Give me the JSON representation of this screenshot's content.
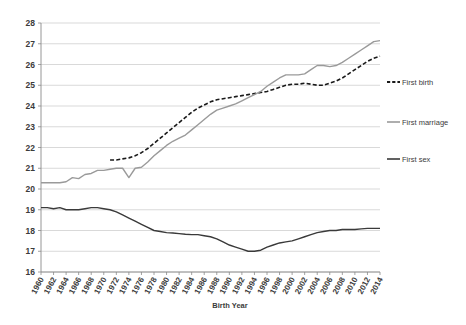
{
  "chart_data": {
    "type": "line",
    "title": "",
    "xlabel": "Birth Year",
    "ylabel": "",
    "xlim": [
      1960,
      2014
    ],
    "ylim": [
      16,
      28
    ],
    "grid": true,
    "legend_position": "right",
    "x_tick_labels": [
      "1960",
      "1962",
      "1964",
      "1966",
      "1968",
      "1970",
      "1972",
      "1974",
      "1976",
      "1978",
      "1980",
      "1982",
      "1984",
      "1986",
      "1988",
      "1990",
      "1992",
      "1994",
      "1996",
      "1998",
      "2000",
      "2002",
      "2004",
      "2006",
      "2008",
      "2010",
      "2012",
      "2014"
    ],
    "y_tick_labels": [
      "16",
      "17",
      "18",
      "19",
      "20",
      "21",
      "22",
      "23",
      "24",
      "25",
      "26",
      "27",
      "28"
    ],
    "x": [
      1960,
      1961,
      1962,
      1963,
      1964,
      1965,
      1966,
      1967,
      1968,
      1969,
      1970,
      1971,
      1972,
      1973,
      1974,
      1975,
      1976,
      1977,
      1978,
      1979,
      1980,
      1981,
      1982,
      1983,
      1984,
      1985,
      1986,
      1987,
      1988,
      1989,
      1990,
      1991,
      1992,
      1993,
      1994,
      1995,
      1996,
      1997,
      1998,
      1999,
      2000,
      2001,
      2002,
      2003,
      2004,
      2005,
      2006,
      2007,
      2008,
      2009,
      2010,
      2011,
      2012,
      2013,
      2014
    ],
    "series": [
      {
        "name": "First birth",
        "color": "#1a1a1a",
        "style": "dashed",
        "x": [
          1971,
          1972,
          1973,
          1974,
          1975,
          1976,
          1977,
          1978,
          1979,
          1980,
          1981,
          1982,
          1983,
          1984,
          1985,
          1986,
          1987,
          1988,
          1989,
          1990,
          1991,
          1992,
          1993,
          1994,
          1995,
          1996,
          1997,
          1998,
          1999,
          2000,
          2001,
          2002,
          2003,
          2004,
          2005,
          2006,
          2007,
          2008,
          2009,
          2010,
          2011,
          2012,
          2013,
          2014
        ],
        "values": [
          21.4,
          21.4,
          21.45,
          21.5,
          21.6,
          21.75,
          21.95,
          22.2,
          22.45,
          22.7,
          22.95,
          23.2,
          23.45,
          23.7,
          23.9,
          24.05,
          24.2,
          24.3,
          24.35,
          24.4,
          24.45,
          24.5,
          24.55,
          24.6,
          24.65,
          24.7,
          24.8,
          24.9,
          25.0,
          25.05,
          25.05,
          25.1,
          25.05,
          25.0,
          25.0,
          25.1,
          25.2,
          25.35,
          25.55,
          25.75,
          25.95,
          26.15,
          26.3,
          26.4
        ]
      },
      {
        "name": "First marriage",
        "color": "#9a9a9a",
        "style": "solid",
        "x": [
          1960,
          1961,
          1962,
          1963,
          1964,
          1965,
          1966,
          1967,
          1968,
          1969,
          1970,
          1971,
          1972,
          1973,
          1974,
          1975,
          1976,
          1977,
          1978,
          1979,
          1980,
          1981,
          1982,
          1983,
          1984,
          1985,
          1986,
          1987,
          1988,
          1989,
          1990,
          1991,
          1992,
          1993,
          1994,
          1995,
          1996,
          1997,
          1998,
          1999,
          2000,
          2001,
          2002,
          2003,
          2004,
          2005,
          2006,
          2007,
          2008,
          2009,
          2010,
          2011,
          2012,
          2013,
          2014
        ],
        "values": [
          20.3,
          20.3,
          20.3,
          20.3,
          20.35,
          20.55,
          20.5,
          20.7,
          20.75,
          20.9,
          20.9,
          20.95,
          21.0,
          21.0,
          20.55,
          21.0,
          21.05,
          21.3,
          21.6,
          21.85,
          22.1,
          22.3,
          22.45,
          22.6,
          22.85,
          23.1,
          23.35,
          23.6,
          23.8,
          23.9,
          24.0,
          24.1,
          24.25,
          24.4,
          24.55,
          24.7,
          24.95,
          25.15,
          25.35,
          25.5,
          25.5,
          25.5,
          25.55,
          25.75,
          25.95,
          25.95,
          25.9,
          25.95,
          26.1,
          26.3,
          26.5,
          26.7,
          26.9,
          27.1,
          27.15
        ]
      },
      {
        "name": "First sex",
        "color": "#3a3a3a",
        "style": "solid",
        "x": [
          1960,
          1961,
          1962,
          1963,
          1964,
          1965,
          1966,
          1967,
          1968,
          1969,
          1970,
          1971,
          1972,
          1973,
          1974,
          1975,
          1976,
          1977,
          1978,
          1979,
          1980,
          1981,
          1982,
          1983,
          1984,
          1985,
          1986,
          1987,
          1988,
          1989,
          1990,
          1991,
          1992,
          1993,
          1994,
          1995,
          1996,
          1997,
          1998,
          1999,
          2000,
          2001,
          2002,
          2003,
          2004,
          2005,
          2006,
          2007,
          2008,
          2009,
          2010,
          2011,
          2012,
          2013,
          2014
        ],
        "values": [
          19.1,
          19.1,
          19.05,
          19.1,
          19.0,
          19.0,
          19.0,
          19.05,
          19.1,
          19.1,
          19.05,
          19.0,
          18.9,
          18.75,
          18.6,
          18.45,
          18.3,
          18.15,
          18.0,
          17.95,
          17.9,
          17.88,
          17.85,
          17.82,
          17.8,
          17.8,
          17.75,
          17.7,
          17.6,
          17.45,
          17.3,
          17.2,
          17.1,
          17.0,
          17.0,
          17.05,
          17.2,
          17.3,
          17.4,
          17.45,
          17.5,
          17.6,
          17.7,
          17.8,
          17.9,
          17.95,
          18.0,
          18.0,
          18.05,
          18.05,
          18.05,
          18.08,
          18.1,
          18.1,
          18.1
        ]
      }
    ]
  },
  "legend": {
    "items": [
      {
        "label": "First birth"
      },
      {
        "label": "First marriage"
      },
      {
        "label": "First sex"
      }
    ]
  },
  "axis": {
    "x_title": "Birth Year"
  }
}
